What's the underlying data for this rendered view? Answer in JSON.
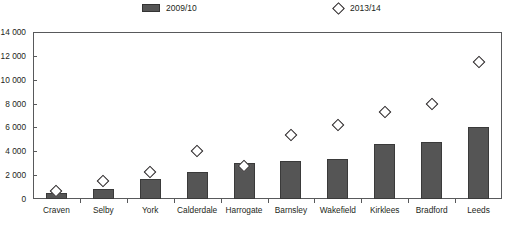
{
  "chart_data": {
    "type": "bar",
    "title": "",
    "subtitle": "",
    "xlabel": "",
    "ylabel": "",
    "ylim": [
      0,
      14000
    ],
    "ytick_step": 2000,
    "ytick_labels": [
      "0",
      "2 000",
      "4 000",
      "6 000",
      "8 000",
      "10 000",
      "12 000",
      "14 000"
    ],
    "ytick_values": [
      0,
      2000,
      4000,
      6000,
      8000,
      10000,
      12000,
      14000
    ],
    "grid": false,
    "legend_position": "top",
    "categories": [
      "Craven",
      "Selby",
      "York",
      "Calderdale",
      "Harrogate",
      "Barnsley",
      "Wakefield",
      "Kirklees",
      "Bradford",
      "Leeds"
    ],
    "series": [
      {
        "name": "2009/10",
        "marker": "bar",
        "color": "#555555",
        "values": [
          500,
          800,
          1700,
          2300,
          3050,
          3200,
          3350,
          4650,
          4750,
          6050
        ]
      },
      {
        "name": "2013/14",
        "marker": "diamond",
        "color": "#231f20",
        "values": [
          650,
          1500,
          2300,
          4000,
          2750,
          5400,
          6200,
          7300,
          7950,
          11500
        ]
      }
    ]
  },
  "legend": {
    "entries": [
      {
        "label": "2009/10",
        "icon": "bar-swatch"
      },
      {
        "label": "2013/14",
        "icon": "diamond-marker"
      }
    ]
  }
}
